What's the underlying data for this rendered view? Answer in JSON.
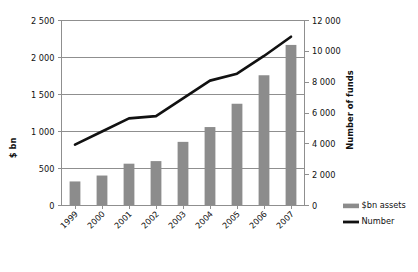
{
  "chart_data": {
    "type": "bar",
    "title": "",
    "subtitle": "",
    "categories": [
      "1999",
      "2000",
      "2001",
      "2002",
      "2003",
      "2004",
      "2005",
      "2006",
      "2007"
    ],
    "series": [
      {
        "name": "$bn assets",
        "type": "bar",
        "axis": "left",
        "color": "#8c8c8c",
        "values": [
          325,
          405,
          565,
          600,
          860,
          1060,
          1375,
          1760,
          2170
        ]
      },
      {
        "name": "Number",
        "type": "line",
        "axis": "right",
        "color": "#111111",
        "values": [
          3950,
          4800,
          5650,
          5800,
          6950,
          8100,
          8550,
          9700,
          10950
        ]
      }
    ],
    "xlabel": "",
    "ylabel": "$ bn",
    "y2label": "Number of funds",
    "ylim": [
      0,
      2500
    ],
    "y2lim": [
      0,
      12000
    ],
    "yticks": [
      0,
      500,
      1000,
      1500,
      2000,
      2500
    ],
    "ytick_labels": [
      "0",
      "500",
      "1 000",
      "1 500",
      "2 000",
      "2 500"
    ],
    "y2ticks": [
      0,
      2000,
      4000,
      6000,
      8000,
      10000,
      12000
    ],
    "y2tick_labels": [
      "0",
      "2 000",
      "4 000",
      "6 000",
      "8 000",
      "10 000",
      "12 000"
    ],
    "grid": "horizontal",
    "legend_position": "right-bottom",
    "legend": [
      {
        "label": "$bn assets",
        "marker": "bar-swatch",
        "color": "#8c8c8c"
      },
      {
        "label": "Number",
        "marker": "line-swatch",
        "color": "#111111"
      }
    ],
    "xtick_rotation": -45
  },
  "axes": {
    "left_title": "$ bn",
    "right_title": "Number of funds"
  },
  "colors": {
    "bar_fill": "#8c8c8c",
    "line_stroke": "#111111",
    "grid": "#8f8f8f",
    "frame": "#8f8f8f",
    "background": "#ffffff"
  }
}
